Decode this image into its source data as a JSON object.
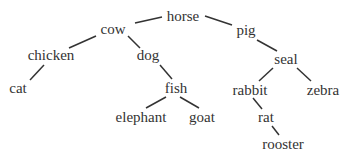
{
  "diagram": {
    "type": "tree",
    "nodes": [
      {
        "id": "horse",
        "label": "horse",
        "x": 183,
        "y": 16
      },
      {
        "id": "cow",
        "label": "cow",
        "x": 113,
        "y": 29
      },
      {
        "id": "pig",
        "label": "pig",
        "x": 246,
        "y": 30
      },
      {
        "id": "chicken",
        "label": "chicken",
        "x": 51,
        "y": 55
      },
      {
        "id": "dog",
        "label": "dog",
        "x": 148,
        "y": 55
      },
      {
        "id": "seal",
        "label": "seal",
        "x": 286,
        "y": 59
      },
      {
        "id": "cat",
        "label": "cat",
        "x": 18,
        "y": 88
      },
      {
        "id": "fish",
        "label": "fish",
        "x": 176,
        "y": 88
      },
      {
        "id": "rabbit",
        "label": "rabbit",
        "x": 250,
        "y": 90
      },
      {
        "id": "zebra",
        "label": "zebra",
        "x": 323,
        "y": 90
      },
      {
        "id": "elephant",
        "label": "elephant",
        "x": 141,
        "y": 117
      },
      {
        "id": "goat",
        "label": "goat",
        "x": 202,
        "y": 117
      },
      {
        "id": "rat",
        "label": "rat",
        "x": 266,
        "y": 117
      },
      {
        "id": "rooster",
        "label": "rooster",
        "x": 283,
        "y": 144
      }
    ],
    "edges": [
      {
        "from": "horse",
        "to": "cow",
        "x1": 162,
        "y1": 17,
        "x2": 135,
        "y2": 23
      },
      {
        "from": "horse",
        "to": "pig",
        "x1": 205,
        "y1": 16,
        "x2": 232,
        "y2": 25
      },
      {
        "from": "cow",
        "to": "chicken",
        "x1": 96,
        "y1": 36,
        "x2": 69,
        "y2": 48
      },
      {
        "from": "cow",
        "to": "dog",
        "x1": 128,
        "y1": 36,
        "x2": 140,
        "y2": 48
      },
      {
        "from": "pig",
        "to": "seal",
        "x1": 257,
        "y1": 40,
        "x2": 277,
        "y2": 51
      },
      {
        "from": "chicken",
        "to": "cat",
        "x1": 44,
        "y1": 65,
        "x2": 30,
        "y2": 80
      },
      {
        "from": "dog",
        "to": "fish",
        "x1": 160,
        "y1": 65,
        "x2": 172,
        "y2": 79
      },
      {
        "from": "seal",
        "to": "rabbit",
        "x1": 273,
        "y1": 68,
        "x2": 259,
        "y2": 81
      },
      {
        "from": "seal",
        "to": "zebra",
        "x1": 297,
        "y1": 68,
        "x2": 311,
        "y2": 81
      },
      {
        "from": "fish",
        "to": "elephant",
        "x1": 166,
        "y1": 97,
        "x2": 146,
        "y2": 108
      },
      {
        "from": "fish",
        "to": "goat",
        "x1": 180,
        "y1": 97,
        "x2": 199,
        "y2": 108
      },
      {
        "from": "rabbit",
        "to": "rat",
        "x1": 253,
        "y1": 98,
        "x2": 262,
        "y2": 109
      },
      {
        "from": "rat",
        "to": "rooster",
        "x1": 272,
        "y1": 126,
        "x2": 279,
        "y2": 135
      }
    ]
  }
}
